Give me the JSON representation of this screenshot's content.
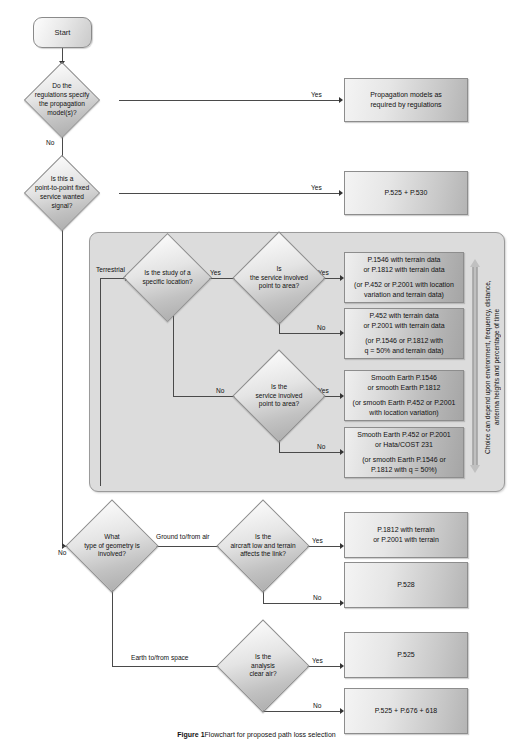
{
  "figure": {
    "caption_label": "Figure 1",
    "caption_text": "Flowchart for proposed path loss selection"
  },
  "nodes": {
    "start": {
      "label": "Start"
    },
    "d_regulations": {
      "lines": [
        "Do the",
        "regulations specify",
        "the propagation",
        "model(s)?"
      ]
    },
    "b_regulations": {
      "lines": [
        "Propagation models as",
        "required by regulations"
      ]
    },
    "d_p2p": {
      "lines": [
        "Is this a",
        "point-to-point fixed",
        "service wanted",
        "signal?"
      ]
    },
    "b_p2p": {
      "lines": [
        "P.525 + P.530"
      ]
    },
    "d_specific_location": {
      "lines": [
        "Is the study of a",
        "specific location?"
      ]
    },
    "d_point_to_area_1": {
      "lines": [
        "Is",
        "the service involved",
        "point  to  area?"
      ]
    },
    "d_point_to_area_2": {
      "lines": [
        "Is the",
        "service involved",
        "point  to  area?"
      ]
    },
    "b_terrain_1546": {
      "lines": [
        "P.1546 with terrain data",
        "or P.1812 with terrain data"
      ],
      "sub": [
        "(or P.452 or P.2001 with location",
        "variation and terrain data)"
      ]
    },
    "b_terrain_452": {
      "lines": [
        "P.452 with terrain data",
        "or P.2001 with terrain data"
      ],
      "sub": [
        "(or P.1546 or P.1812 with",
        "q = 50% and terrain data)"
      ]
    },
    "b_smooth_1546": {
      "lines": [
        "Smooth Earth P.1546",
        "or smooth Earth P.1812"
      ],
      "sub": [
        "(or smooth Earth P.452 or P.2001",
        "with location variation)"
      ]
    },
    "b_smooth_452": {
      "lines": [
        "Smooth Earth P.452 or P.2001",
        "or Hata/COST 231"
      ],
      "sub": [
        "(or smooth Earth P.1546 or",
        "P.1812 with q = 50%)"
      ]
    },
    "d_geometry": {
      "lines": [
        "What",
        "type of geometry is",
        "involved?"
      ]
    },
    "d_aircraft": {
      "lines": [
        "Is the",
        "aircraft low and terrain",
        "affects the link?"
      ]
    },
    "b_aircraft_terrain": {
      "lines": [
        "P.1812 with terrain",
        "or P.2001 with terrain"
      ]
    },
    "b_p528": {
      "lines": [
        "P.528"
      ]
    },
    "d_clear_air": {
      "lines": [
        "Is the",
        "analysis",
        "clear air?"
      ]
    },
    "b_p525": {
      "lines": [
        "P.525"
      ]
    },
    "b_p525_676_618": {
      "lines": [
        "P.525 + P.676 + 618"
      ]
    }
  },
  "edge_labels": {
    "yes_regulations": "Yes",
    "no_regulations": "No",
    "yes_p2p": "Yes",
    "terrestrial": "Terrestrial",
    "yes_specific_location": "Yes",
    "no_specific_location": "No",
    "yes_pta_1": "Yes",
    "no_pta_1": "No",
    "yes_pta_2": "Yes",
    "no_pta_2": "No",
    "no_geometry_entry": "No",
    "ground_to_from_air": "Ground to/from air",
    "earth_to_from_space": "Earth to/from space",
    "yes_aircraft": "Yes",
    "no_aircraft": "No",
    "yes_clear_air": "Yes",
    "no_clear_air": "No"
  },
  "annotations": {
    "choice_note": "Choice can depend upon environment, frequency, distance,\nantenna heights and percentage of time"
  },
  "colors": {
    "line": "#4a4a4a",
    "group_fill": "#dcdcdc",
    "node_border": "#8d8d8d",
    "text": "#111111"
  }
}
